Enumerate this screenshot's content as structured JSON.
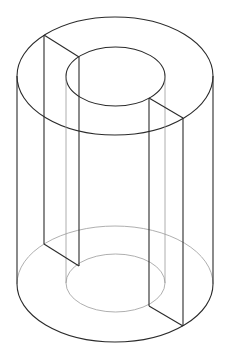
{
  "figure": {
    "colors": {
      "line": "#2b2b2b",
      "hidden_line": "#9a9a9a",
      "background": "#ffffff"
    },
    "geometry": {
      "center_x": 115,
      "top_center_y": 76,
      "bottom_center_y": 284,
      "outer_rx": 98,
      "outer_ry": 59,
      "inner_rx": 49.5,
      "inner_ry": 29.5,
      "cut_outer_left": [
        44,
        35
      ],
      "cut_inner_left": [
        79,
        57
      ],
      "cut_inner_right": [
        149,
        98
      ],
      "cut_outer_right": [
        183,
        118
      ]
    }
  }
}
